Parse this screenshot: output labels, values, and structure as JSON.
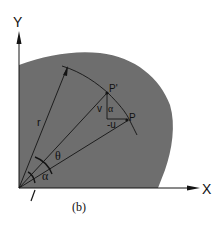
{
  "figure": {
    "caption": "(b)",
    "colors": {
      "region_fill": "#6e6e6e",
      "line": "#141414",
      "background": "#ffffff"
    },
    "axes": {
      "x_label": "X",
      "y_label": "Y"
    },
    "labels": {
      "radius": "r",
      "angle_theta": "θ",
      "angle_alpha": "α",
      "angle_alpha_small": "α",
      "point_p_prime": "P'",
      "point_p": "P",
      "component_v": "v",
      "component_u": "-u"
    }
  }
}
